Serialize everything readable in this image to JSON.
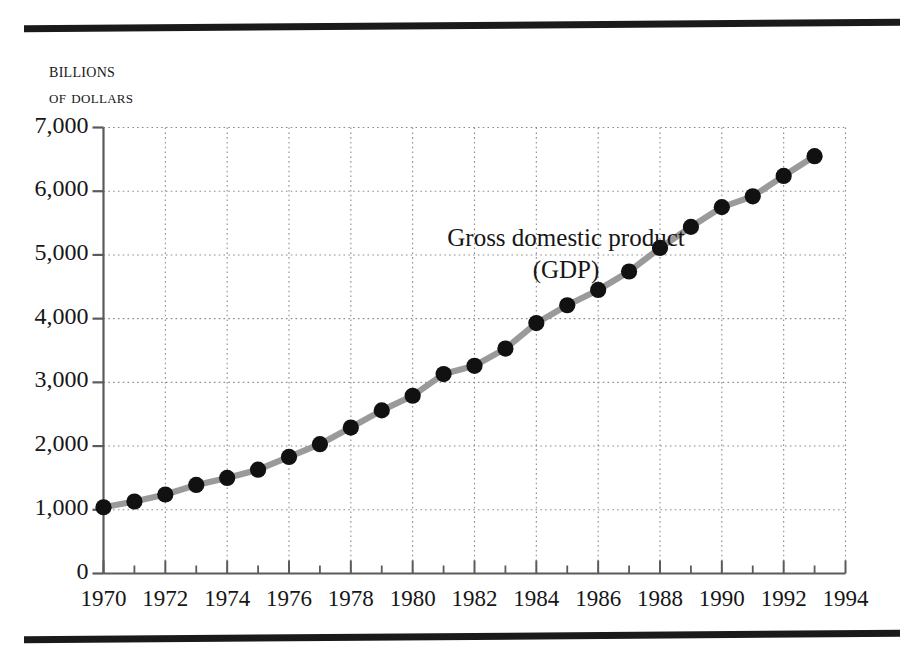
{
  "figure": {
    "y_axis_caption_lines": [
      "Billions",
      "of dollars"
    ],
    "annotation": {
      "line1": "Gross domestic product",
      "line2": "(GDP)"
    }
  },
  "chart_data": {
    "type": "line",
    "title": "",
    "subtitle": "",
    "xlabel": "",
    "ylabel": "Billions of dollars",
    "grid": true,
    "legend_position": "inline-annotation",
    "xlim": [
      1970,
      1994
    ],
    "ylim": [
      0,
      7000
    ],
    "xticks": [
      1970,
      1972,
      1974,
      1976,
      1978,
      1980,
      1982,
      1984,
      1986,
      1988,
      1990,
      1992,
      1994
    ],
    "xtick_labels": [
      "1970",
      "1972",
      "1974",
      "1976",
      "1978",
      "1980",
      "1982",
      "1984",
      "1986",
      "1988",
      "1990",
      "1992",
      "1994"
    ],
    "xtick_minor": [
      1971,
      1973,
      1975,
      1977,
      1979,
      1981,
      1983,
      1985,
      1987,
      1989,
      1991,
      1993
    ],
    "yticks": [
      0,
      1000,
      2000,
      3000,
      4000,
      5000,
      6000,
      7000
    ],
    "ytick_labels": [
      "0",
      "1,000",
      "2,000",
      "3,000",
      "4,000",
      "5,000",
      "6,000",
      "7,000"
    ],
    "series": [
      {
        "name": "Gross domestic product (GDP)",
        "line_color": "#9a9a9a",
        "marker_color": "#111111",
        "x": [
          1970,
          1971,
          1972,
          1973,
          1974,
          1975,
          1976,
          1977,
          1978,
          1979,
          1980,
          1981,
          1982,
          1983,
          1984,
          1985,
          1986,
          1987,
          1988,
          1989,
          1990,
          1991,
          1992,
          1993
        ],
        "values": [
          1040,
          1130,
          1240,
          1390,
          1500,
          1630,
          1830,
          2030,
          2290,
          2560,
          2790,
          3130,
          3260,
          3530,
          3930,
          4210,
          4450,
          4740,
          5110,
          5440,
          5750,
          5920,
          6240,
          6550
        ]
      }
    ]
  }
}
